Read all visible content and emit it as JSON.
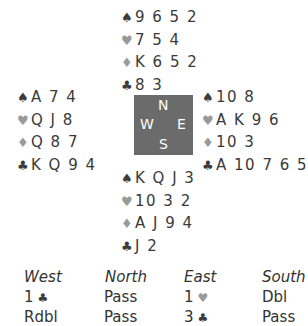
{
  "suits": {
    "spades": {
      "glyph": "♠",
      "tone": "dark"
    },
    "hearts": {
      "glyph": "♥",
      "tone": "light"
    },
    "diamonds": {
      "glyph": "♦",
      "tone": "light"
    },
    "clubs": {
      "glyph": "♣",
      "tone": "dark"
    }
  },
  "hands": {
    "north": {
      "spades": "9 6 5 2",
      "hearts": "7 5 4",
      "diamonds": "K 6 5 2",
      "clubs": "8 3"
    },
    "west": {
      "spades": "A 7 4",
      "hearts": "Q J 8",
      "diamonds": "Q 8 7",
      "clubs": "K Q 9 4"
    },
    "east": {
      "spades": "10 8",
      "hearts": "A K 9 6",
      "diamonds": "10 3",
      "clubs": "A 10 7 6 5"
    },
    "south": {
      "spades": "K Q J 3",
      "hearts": "10 3 2",
      "diamonds": "A J 9 4",
      "clubs": "J 2"
    }
  },
  "compass": {
    "north": "N",
    "west": "W",
    "east": "E",
    "south": "S",
    "color": "#6b6b6b"
  },
  "auction": {
    "headers": [
      "West",
      "North",
      "East",
      "South"
    ],
    "rounds": [
      [
        {
          "text": "1",
          "suit": "♣"
        },
        {
          "text": "Pass"
        },
        {
          "text": "1",
          "suit": "♥"
        },
        {
          "text": "Dbl"
        }
      ],
      [
        {
          "text": "Rdbl"
        },
        {
          "text": "Pass"
        },
        {
          "text": "3",
          "suit": "♣"
        },
        {
          "text": "Pass"
        }
      ]
    ]
  }
}
